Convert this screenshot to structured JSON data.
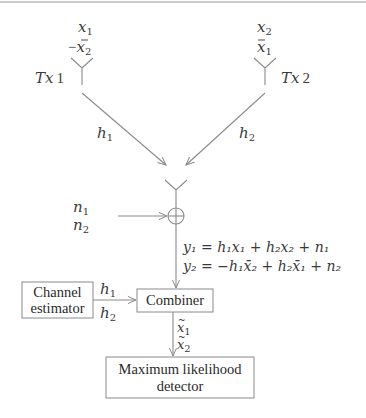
{
  "diagram": {
    "transmitters": [
      {
        "label": "Tx 1",
        "label_var": "Tx",
        "label_num": "1",
        "symbols": [
          {
            "sign": "",
            "var": "x",
            "bar": false,
            "sub": "1"
          },
          {
            "sign": "−",
            "var": "x",
            "bar": true,
            "sub": "2"
          }
        ],
        "channel": {
          "var": "h",
          "sub": "1"
        }
      },
      {
        "label": "Tx 2",
        "label_var": "Tx",
        "label_num": "2",
        "symbols": [
          {
            "sign": "",
            "var": "x",
            "bar": false,
            "sub": "2"
          },
          {
            "sign": "",
            "var": "x",
            "bar": true,
            "sub": "1"
          }
        ],
        "channel": {
          "var": "h",
          "sub": "2"
        }
      }
    ],
    "receiver": {
      "noise": [
        {
          "var": "n",
          "sub": "1"
        },
        {
          "var": "n",
          "sub": "2"
        }
      ],
      "adder_symbol": "⊕",
      "equations": [
        "y₁ = h₁x₁ + h₂x₂ + n₁",
        "y₂ = −h₁x̄₂ + h₂x̄₁ + n₂"
      ]
    },
    "blocks": {
      "channel_estimator": {
        "line1": "Channel",
        "line2": "estimator"
      },
      "combiner": {
        "label": "Combiner"
      },
      "detector": {
        "line1": "Maximum likelihood",
        "line2": "detector"
      }
    },
    "estimator_outputs": [
      {
        "var": "h",
        "sub": "1"
      },
      {
        "var": "h",
        "sub": "2"
      }
    ],
    "combiner_outputs": [
      {
        "var": "x",
        "tilde": true,
        "sub": "1"
      },
      {
        "var": "x",
        "tilde": true,
        "sub": "2"
      }
    ],
    "colors": {
      "line": "#8a8a8a",
      "text": "#2a2a2a",
      "background": "#ffffff"
    }
  }
}
